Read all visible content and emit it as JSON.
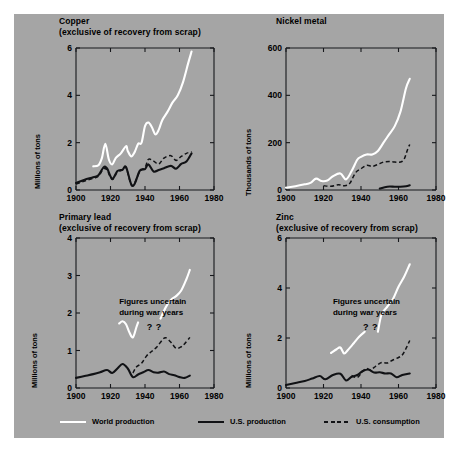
{
  "figure": {
    "background_color": "#a5a5a5",
    "page_color": "#ffffff",
    "line_colors": {
      "world_production": "#ffffff",
      "us_production": "#111215",
      "us_consumption": "#111215"
    }
  },
  "legend": {
    "items": [
      {
        "label": "World production",
        "style": "solid-white"
      },
      {
        "label": "U.S. production",
        "style": "solid-black"
      },
      {
        "label": "U.S. consumption",
        "style": "dashed-black"
      }
    ]
  },
  "chart_data": [
    {
      "type": "line",
      "id": "copper",
      "title": "Copper",
      "subtitle": "(exclusive of recovery from scrap)",
      "xlabel": "",
      "ylabel": "Millions of tons",
      "xlim": [
        1900,
        1980
      ],
      "ylim": [
        0,
        6
      ],
      "xticks": [
        1900,
        1920,
        1940,
        1960,
        1980
      ],
      "yticks": [
        0,
        2,
        4,
        6
      ],
      "grid": false,
      "legend_position": "figure-bottom",
      "series": [
        {
          "name": "World production",
          "x": [
            1910,
            1913,
            1915,
            1917,
            1919,
            1921,
            1923,
            1926,
            1929,
            1930,
            1932,
            1934,
            1936,
            1938,
            1940,
            1942,
            1944,
            1946,
            1948,
            1950,
            1953,
            1956,
            1959,
            1962,
            1965,
            1967
          ],
          "y": [
            1.0,
            1.05,
            1.35,
            1.95,
            1.3,
            1.08,
            1.35,
            1.55,
            1.85,
            1.65,
            1.42,
            1.6,
            1.95,
            2.0,
            2.7,
            2.85,
            2.65,
            2.35,
            2.55,
            2.95,
            3.3,
            3.7,
            4.0,
            4.55,
            5.35,
            5.85
          ]
        },
        {
          "name": "U.S. production",
          "x": [
            1900,
            1905,
            1910,
            1913,
            1916,
            1918,
            1921,
            1924,
            1927,
            1929,
            1932,
            1934,
            1937,
            1940,
            1942,
            1945,
            1948,
            1951,
            1955,
            1958,
            1961,
            1964,
            1967
          ],
          "y": [
            0.3,
            0.43,
            0.54,
            0.62,
            0.96,
            0.91,
            0.48,
            0.8,
            0.86,
            0.97,
            0.24,
            0.26,
            0.82,
            0.88,
            1.08,
            0.78,
            0.85,
            0.92,
            1.02,
            0.9,
            1.1,
            1.2,
            1.55
          ]
        },
        {
          "name": "U.S. consumption",
          "x": [
            1900,
            1905,
            1910,
            1913,
            1916,
            1918,
            1921,
            1924,
            1927,
            1929,
            1932,
            1934,
            1937,
            1940,
            1942,
            1945,
            1948,
            1951,
            1955,
            1958,
            1961,
            1964,
            1967
          ],
          "y": [
            0.25,
            0.38,
            0.5,
            0.58,
            0.9,
            0.84,
            0.44,
            0.76,
            0.84,
            0.95,
            0.22,
            0.3,
            0.78,
            0.95,
            1.3,
            1.22,
            1.1,
            1.35,
            1.45,
            1.25,
            1.42,
            1.55,
            1.62
          ]
        }
      ]
    },
    {
      "type": "line",
      "id": "nickel",
      "title": "Nickel metal",
      "subtitle": "",
      "xlabel": "",
      "ylabel": "Thousands of tons",
      "xlim": [
        1900,
        1980
      ],
      "ylim": [
        0,
        600
      ],
      "xticks": [
        1900,
        1920,
        1940,
        1960,
        1980
      ],
      "yticks": [
        0,
        200,
        400,
        600
      ],
      "grid": false,
      "legend_position": "figure-bottom",
      "series": [
        {
          "name": "World production",
          "x": [
            1900,
            1905,
            1910,
            1913,
            1916,
            1919,
            1922,
            1925,
            1929,
            1932,
            1935,
            1938,
            1940,
            1943,
            1946,
            1949,
            1952,
            1955,
            1958,
            1961,
            1964,
            1966
          ],
          "y": [
            10,
            16,
            24,
            30,
            48,
            38,
            40,
            58,
            70,
            45,
            80,
            128,
            140,
            150,
            150,
            165,
            200,
            235,
            270,
            330,
            430,
            470
          ]
        },
        {
          "name": "U.S. production",
          "x": [
            1950,
            1954,
            1958,
            1961,
            1964,
            1966
          ],
          "y": [
            6,
            14,
            14,
            14,
            16,
            20
          ]
        },
        {
          "name": "U.S. consumption",
          "x": [
            1920,
            1924,
            1928,
            1931,
            1934,
            1937,
            1940,
            1943,
            1946,
            1949,
            1952,
            1955,
            1958,
            1961,
            1963,
            1965,
            1966
          ],
          "y": [
            18,
            16,
            22,
            18,
            28,
            72,
            90,
            104,
            100,
            108,
            118,
            120,
            118,
            118,
            130,
            175,
            192
          ]
        }
      ]
    },
    {
      "type": "line",
      "id": "primary-lead",
      "title": "Primary lead",
      "subtitle": "(exclusive of recovery from scrap)",
      "xlabel": "",
      "ylabel": "Millions of tons",
      "xlim": [
        1900,
        1980
      ],
      "ylim": [
        0,
        4
      ],
      "xticks": [
        1900,
        1920,
        1940,
        1960,
        1980
      ],
      "yticks": [
        0,
        1,
        2,
        3,
        4
      ],
      "grid": false,
      "legend_position": "figure-bottom",
      "annotation": "Figures uncertain\nduring war years",
      "annotation_marks": [
        "?",
        "?"
      ],
      "series": [
        {
          "name": "World production",
          "x": [
            1925,
            1927,
            1929,
            1931,
            1933,
            1935,
            1936
          ],
          "y": [
            1.72,
            1.78,
            1.7,
            1.48,
            1.35,
            1.62,
            1.75
          ]
        },
        {
          "name": "World production (postwar)",
          "x": [
            1949,
            1952,
            1955,
            1958,
            1961,
            1964,
            1966
          ],
          "y": [
            1.85,
            2.15,
            2.35,
            2.45,
            2.6,
            2.9,
            3.15
          ]
        },
        {
          "name": "U.S. production",
          "x": [
            1900,
            1905,
            1910,
            1914,
            1918,
            1921,
            1924,
            1927,
            1930,
            1933,
            1936,
            1939,
            1942,
            1945,
            1948,
            1951,
            1954,
            1957,
            1960,
            1963,
            1966
          ],
          "y": [
            0.27,
            0.32,
            0.37,
            0.42,
            0.48,
            0.4,
            0.52,
            0.64,
            0.52,
            0.29,
            0.36,
            0.42,
            0.48,
            0.42,
            0.41,
            0.44,
            0.37,
            0.34,
            0.29,
            0.27,
            0.33
          ]
        },
        {
          "name": "U.S. consumption",
          "x": [
            1933,
            1935,
            1938,
            1941,
            1944,
            1947,
            1950,
            1952,
            1955,
            1958,
            1961,
            1963,
            1966
          ],
          "y": [
            0.4,
            0.56,
            0.66,
            0.86,
            0.98,
            1.1,
            1.28,
            1.34,
            1.22,
            1.06,
            1.1,
            1.18,
            1.35
          ]
        }
      ]
    },
    {
      "type": "line",
      "id": "zinc",
      "title": "Zinc",
      "subtitle": "(exclusive of recovery from scrap)",
      "xlabel": "",
      "ylabel": "Millions of tons",
      "xlim": [
        1900,
        1980
      ],
      "ylim": [
        0,
        6
      ],
      "xticks": [
        1900,
        1920,
        1940,
        1960,
        1980
      ],
      "yticks": [
        0,
        2,
        4,
        6
      ],
      "grid": false,
      "legend_position": "figure-bottom",
      "annotation": "Figures uncertain\nduring war years",
      "annotation_marks": [
        "?",
        "?"
      ],
      "series": [
        {
          "name": "World production",
          "x": [
            1924,
            1927,
            1929,
            1931,
            1933,
            1936,
            1939,
            1942
          ],
          "y": [
            1.4,
            1.55,
            1.62,
            1.38,
            1.52,
            1.78,
            2.05,
            2.25
          ]
        },
        {
          "name": "World production (postwar)",
          "x": [
            1949,
            1951,
            1954,
            1957,
            1960,
            1963,
            1966
          ],
          "y": [
            2.25,
            2.95,
            3.25,
            3.55,
            4.05,
            4.45,
            4.95
          ]
        },
        {
          "name": "U.S. production",
          "x": [
            1900,
            1905,
            1910,
            1914,
            1918,
            1921,
            1925,
            1929,
            1932,
            1935,
            1938,
            1941,
            1944,
            1947,
            1950,
            1953,
            1956,
            1959,
            1962,
            1966
          ],
          "y": [
            0.12,
            0.2,
            0.28,
            0.38,
            0.48,
            0.35,
            0.52,
            0.57,
            0.3,
            0.45,
            0.52,
            0.68,
            0.74,
            0.62,
            0.63,
            0.58,
            0.58,
            0.43,
            0.52,
            0.58
          ]
        },
        {
          "name": "U.S. consumption",
          "x": [
            1935,
            1938,
            1941,
            1943,
            1945,
            1948,
            1951,
            1954,
            1957,
            1960,
            1962,
            1964,
            1966
          ],
          "y": [
            0.5,
            0.42,
            0.68,
            0.78,
            0.72,
            0.88,
            1.02,
            1.0,
            1.12,
            1.22,
            1.32,
            1.58,
            1.9
          ]
        }
      ]
    }
  ]
}
